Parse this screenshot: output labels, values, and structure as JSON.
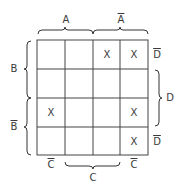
{
  "columns": {
    "top_labels": [
      {
        "text": "A",
        "bar": false
      },
      {
        "text": "A",
        "bar": true
      }
    ],
    "bottom_labels": [
      {
        "text": "C",
        "bar": true
      },
      {
        "text": "C",
        "bar": false
      },
      {
        "text": "C",
        "bar": true
      }
    ]
  },
  "rows": {
    "left_labels": [
      {
        "text": "B",
        "bar": false
      },
      {
        "text": "B",
        "bar": true
      }
    ],
    "right_labels": [
      {
        "text": "D",
        "bar": true
      },
      {
        "text": "D",
        "bar": false
      },
      {
        "text": "D",
        "bar": true
      }
    ]
  },
  "cells": [
    [
      "",
      "",
      "X",
      "X"
    ],
    [
      "",
      "",
      "",
      ""
    ],
    [
      "X",
      "",
      "",
      "X"
    ],
    [
      "",
      "",
      "",
      "X"
    ]
  ]
}
